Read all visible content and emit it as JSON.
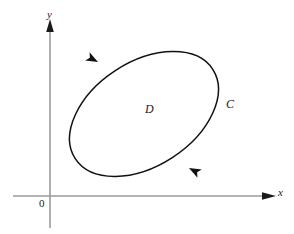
{
  "figure": {
    "background_color": "#ffffff",
    "axes": {
      "color": "#9a9a9a",
      "arrow_color": "#1a1a1a",
      "x_axis": {
        "label": "x",
        "start_x": 13,
        "end_x": 275,
        "y": 196
      },
      "y_axis": {
        "label": "y",
        "x": 50,
        "start_y": 228,
        "end_y": 22
      },
      "origin_label": "0",
      "origin_x": 50,
      "origin_y": 196
    },
    "curve": {
      "name": "C",
      "label": "C",
      "color": "#111111",
      "shape": "ellipse",
      "orientation": "counterclockwise",
      "center_x": 144,
      "center_y": 114,
      "radius_x": 82,
      "radius_y": 52,
      "rotation_degrees": -33,
      "label_x": 226,
      "label_y": 98
    },
    "region": {
      "name": "D",
      "label": "D",
      "label_x": 145,
      "label_y": 103
    },
    "direction_arrows": [
      {
        "name": "upper-left-direction-arrow",
        "x": 98,
        "y": 62,
        "angle_degrees": 208
      },
      {
        "name": "lower-right-direction-arrow",
        "x": 189,
        "y": 168,
        "angle_degrees": 28
      }
    ]
  }
}
